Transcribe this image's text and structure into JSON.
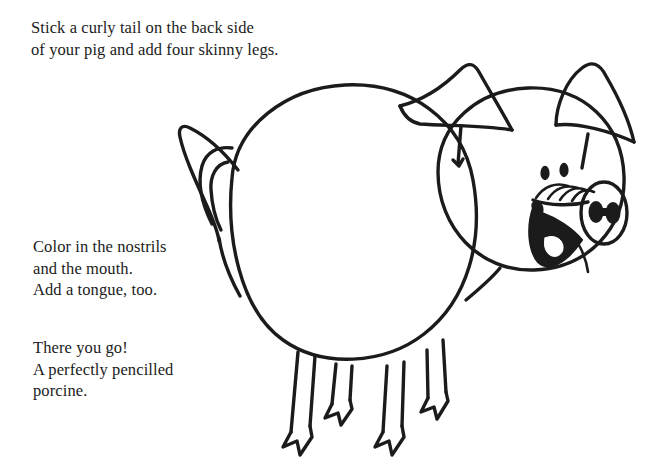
{
  "page": {
    "background_color": "#ffffff",
    "ink_color": "#1b1b1b",
    "width": 652,
    "height": 472
  },
  "instructions": [
    {
      "id": "step-tail-legs",
      "text": "Stick a curly tail on the back side\nof your pig and add four skinny legs."
    },
    {
      "id": "step-nostrils-mouth",
      "text": "Color in the nostrils\nand the mouth.\nAdd a tongue, too."
    },
    {
      "id": "step-finished",
      "text": "There you go!\nA perfectly pencilled\nporcine."
    }
  ],
  "illustration": {
    "subject": "pig",
    "style": "black line drawing, hand-drawn",
    "stroke_color": "#1b1b1b",
    "fill_color": "#ffffff",
    "parts": [
      "body",
      "head",
      "left-ear",
      "right-ear",
      "curly-tail",
      "snout",
      "nostrils",
      "eyes",
      "mouth",
      "tongue",
      "front-legs",
      "hind-legs",
      "hooves"
    ],
    "counts": {
      "legs": 4,
      "ears": 2,
      "eyes": 2,
      "nostrils": 2
    }
  }
}
